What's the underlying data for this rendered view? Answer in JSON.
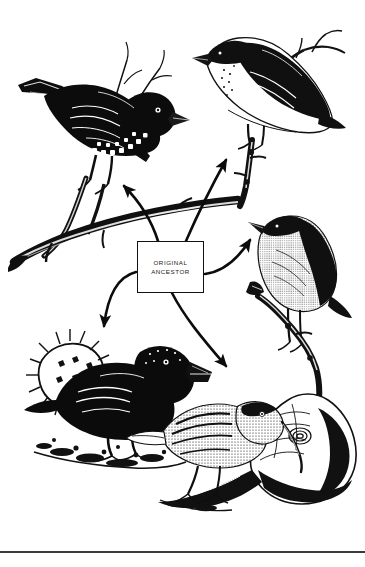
{
  "figure": {
    "background_color": "#ffffff",
    "ink_color": "#000000",
    "width": 365,
    "height": 567
  },
  "central_label": {
    "name": "original-ancestor-box",
    "line1": "ORIGINAL",
    "line2": "ANCESTOR",
    "border_color": "#111111",
    "fill_color": "#ffffff"
  },
  "arrows": [
    {
      "id": "arrow-up-left",
      "direction": "up-left",
      "target": "bird-top-left"
    },
    {
      "id": "arrow-up-right",
      "direction": "up-right",
      "target": "bird-top-right"
    },
    {
      "id": "arrow-right",
      "direction": "right",
      "target": "bird-right"
    },
    {
      "id": "arrow-down-left",
      "direction": "down-left",
      "target": "bird-bottom-left"
    },
    {
      "id": "arrow-down-right",
      "direction": "down-right",
      "target": "bird-bottom-center"
    }
  ],
  "birds": [
    {
      "id": "bird-top-left",
      "position": "top-left",
      "description": "dark finch facing right perched on branch"
    },
    {
      "id": "bird-top-right",
      "position": "top-right",
      "description": "pale-breasted finch facing left on vertical branch"
    },
    {
      "id": "bird-right",
      "position": "right",
      "description": "warbler finch facing left on branch"
    },
    {
      "id": "bird-bottom-left",
      "position": "bottom-left",
      "description": "black ground finch with large beak beside spiny cactus"
    },
    {
      "id": "bird-bottom-center",
      "position": "bottom-center",
      "description": "woodpecker finch probing log with long slender beak"
    }
  ],
  "footer": {
    "rule_color": "#3a3a3a"
  }
}
